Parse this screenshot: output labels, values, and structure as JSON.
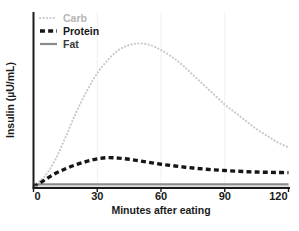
{
  "chart_data": {
    "type": "line",
    "title": "",
    "xlabel": "Minutes after eating",
    "ylabel": "Insulin (µU/mL)",
    "xlim": [
      0,
      120
    ],
    "ylim": [
      0,
      100
    ],
    "xticks": [
      "0",
      "30",
      "60",
      "90",
      "120"
    ],
    "xtick_values": [
      0,
      30,
      60,
      90,
      120
    ],
    "yticks": [],
    "grid": "vertical-faint",
    "legend_position": "top-left",
    "x": [
      0,
      5,
      10,
      15,
      20,
      25,
      30,
      35,
      40,
      45,
      50,
      55,
      60,
      65,
      70,
      75,
      80,
      85,
      90,
      95,
      100,
      105,
      110,
      115,
      120
    ],
    "series": [
      {
        "name": "Carb",
        "style": "dotted",
        "color": "#c9c9c9",
        "width": 2.1,
        "values": [
          1,
          6,
          16,
          30,
          45,
          58,
          69,
          77,
          83,
          86,
          87,
          86,
          83,
          79,
          74,
          68,
          62,
          56,
          50,
          45,
          40,
          35,
          31,
          27,
          24
        ]
      },
      {
        "name": "Protein",
        "style": "dashed",
        "color": "#161616",
        "width": 3.4,
        "values": [
          0,
          4,
          8,
          11,
          13.5,
          15.5,
          17,
          17.8,
          17.5,
          16.8,
          15.8,
          14.8,
          13.8,
          13,
          12.2,
          11.5,
          10.9,
          10.4,
          10,
          9.6,
          9.3,
          9.1,
          8.9,
          8.8,
          8.7
        ]
      },
      {
        "name": "Fat",
        "style": "solid",
        "color": "#8a8a8a",
        "width": 2.2,
        "values": [
          1.6,
          1.6,
          1.6,
          1.6,
          1.6,
          1.6,
          1.6,
          1.6,
          1.6,
          1.6,
          1.6,
          1.6,
          1.6,
          1.6,
          1.6,
          1.6,
          1.6,
          1.6,
          1.6,
          1.6,
          1.6,
          1.6,
          1.6,
          1.6,
          1.6
        ]
      }
    ]
  },
  "legend": {
    "items": [
      {
        "label": "Carb",
        "color": "#c9c9c9",
        "text_color": "#b5b5b5"
      },
      {
        "label": "Protein",
        "color": "#161616",
        "text_color": "#161616"
      },
      {
        "label": "Fat",
        "color": "#8a8a8a",
        "text_color": "#3a3a3a"
      }
    ]
  },
  "axes": {
    "x_title": "Minutes after eating",
    "y_title": "Insulin (µU/mL)",
    "axis_color": "#1b1b1b",
    "gridline_color": "#f0f0f0"
  }
}
